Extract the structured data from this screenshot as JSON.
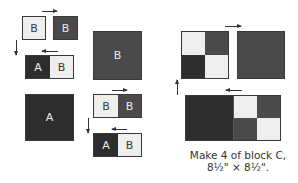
{
  "labels": {
    "b1": "B",
    "b2": "B",
    "a_row1": "A",
    "b_row1": "B",
    "big_b": "B",
    "big_a": "A",
    "b_row2_left": "B",
    "b_row2_right": "B",
    "a_row3": "A",
    "b_row3": "B"
  },
  "caption": {
    "line1": "Make 4 of block C,",
    "line2": "8½\" × 8½\"."
  },
  "colors": {
    "light_fabric": "#eeeeee",
    "medium_fabric": "#4a4a4a",
    "dark_fabric": "#2d2d2d",
    "outline": "#3a3a3a"
  }
}
